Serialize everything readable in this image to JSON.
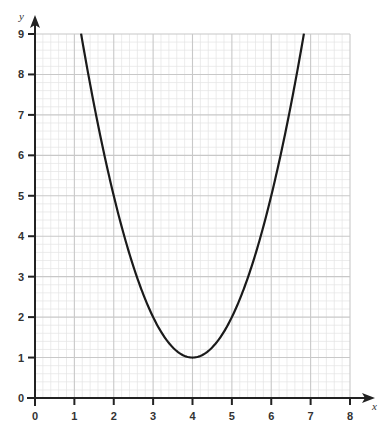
{
  "chart_data": {
    "type": "line",
    "title": "",
    "xlabel": "x",
    "ylabel": "y",
    "xlim": [
      0,
      8
    ],
    "ylim": [
      0,
      9
    ],
    "x_ticks": [
      "0",
      "1",
      "2",
      "3",
      "4",
      "5",
      "6",
      "7",
      "8"
    ],
    "y_ticks": [
      "0",
      "1",
      "2",
      "3",
      "4",
      "5",
      "6",
      "7",
      "8",
      "9"
    ],
    "grid": {
      "on": true,
      "major_step": 1,
      "minor_divisions": 5
    },
    "legend": null,
    "series": [
      {
        "name": "y = (x - 4)^2 + 1",
        "equation": "y = x^2 - 8x + 17",
        "vertex": [
          4,
          1
        ],
        "x": [
          1.17,
          1.5,
          2,
          2.5,
          3,
          3.5,
          4,
          4.5,
          5,
          5.5,
          6,
          6.5,
          6.83
        ],
        "y": [
          9,
          7.25,
          5,
          3.25,
          2,
          1.25,
          1,
          1.25,
          2,
          3.25,
          5,
          7.25,
          9
        ]
      }
    ]
  },
  "colors": {
    "curve": "#1a1a1a",
    "axis": "#222222",
    "grid_major": "#c8c8c8",
    "grid_minor": "#e4e4e4",
    "background": "#ffffff"
  }
}
